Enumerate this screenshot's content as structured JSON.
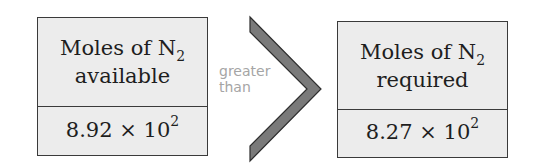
{
  "left_box": {
    "label_prefix": "Moles of N",
    "label_subscript": "2",
    "label_line2": "available",
    "value_mantissa": "8.92 × 10",
    "value_exponent": "2"
  },
  "relation": {
    "line1": "greater",
    "line2": "than",
    "symbol": "chevron-greater-than",
    "color": "#7a7a7a"
  },
  "right_box": {
    "label_prefix": "Moles of N",
    "label_subscript": "2",
    "label_line2": "required",
    "value_mantissa": "8.27 × 10",
    "value_exponent": "2"
  },
  "colors": {
    "box_fill": "#ececec",
    "box_border": "#3a3a3a",
    "relation_text": "#a5a5a5"
  }
}
